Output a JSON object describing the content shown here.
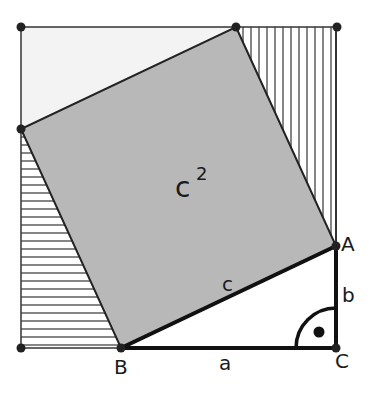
{
  "figure": {
    "labels": {
      "area": "c",
      "area_exp": "2",
      "hyp": "c",
      "leg_a": "a",
      "leg_b": "b",
      "vertex_A": "A",
      "vertex_B": "B",
      "vertex_C": "C"
    },
    "colors": {
      "square_fill": "#b8b8b8",
      "light_region": "#f3f3f3",
      "line": "#222222"
    }
  }
}
